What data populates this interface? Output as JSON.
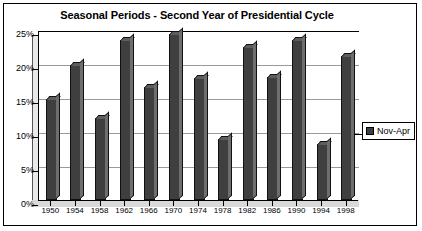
{
  "window": {
    "title": "Seasonal Periods - Second Year of Presidential Cycle"
  },
  "legend": {
    "position": "right",
    "entries": [
      {
        "label": "Nov-Apr",
        "color": "#3f3f3f",
        "marker": "filled-square"
      }
    ]
  },
  "axes": {
    "y_ticks": [
      "0%",
      "5%",
      "10%",
      "15%",
      "20%",
      "25%"
    ],
    "x_ticks": [
      "1950",
      "1954",
      "1958",
      "1962",
      "1966",
      "1970",
      "1974",
      "1978",
      "1982",
      "1986",
      "1990",
      "1994",
      "1998"
    ]
  },
  "chart_data": {
    "type": "bar",
    "title": "Seasonal Periods - Second Year of Presidential Cycle",
    "xlabel": "",
    "ylabel": "",
    "ylim": [
      0,
      25
    ],
    "ytick_values": [
      0,
      5,
      10,
      15,
      20,
      25
    ],
    "ytick_labels": [
      "0%",
      "5%",
      "10%",
      "15%",
      "20%",
      "25%"
    ],
    "grid": true,
    "grid_axis": "y",
    "legend_position": "right",
    "style": "3d-column",
    "bar_color": "#4a4a4a",
    "categories": [
      "1950",
      "1954",
      "1958",
      "1962",
      "1966",
      "1970",
      "1974",
      "1978",
      "1982",
      "1986",
      "1990",
      "1994",
      "1998"
    ],
    "series": [
      {
        "name": "Nov-Apr",
        "color": "#3f3f3f",
        "values": [
          14.8,
          19.8,
          12.0,
          23.5,
          16.6,
          24.4,
          17.9,
          8.9,
          22.5,
          18.1,
          23.5,
          8.3,
          21.2
        ]
      }
    ]
  }
}
